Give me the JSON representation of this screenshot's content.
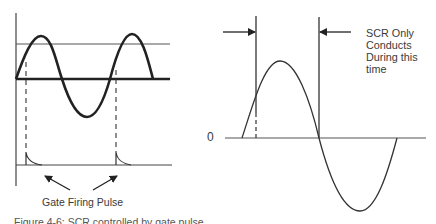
{
  "left_diagram": {
    "title": "AC input with gate firing pulses",
    "gate_label": "Gate Firing Pulse",
    "pulse_count": 2
  },
  "right_diagram": {
    "zero_label": "0",
    "annotation_lines": [
      "SCR Only",
      "Conducts",
      "During this",
      "time"
    ]
  },
  "caption": "Figure 4-6: SCR controlled by gate pulse",
  "colors": {
    "line": "#222222",
    "thin_line": "#444444",
    "text": "#3a3a3a",
    "background": "#ffffff"
  }
}
